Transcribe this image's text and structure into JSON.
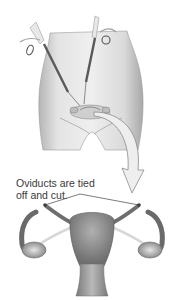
{
  "figure": {
    "top_panel": "Lower abdomen with two laparoscopic instruments inserted toward the pelvic organs",
    "bottom_panel": "Uterus with both oviducts tied off and cut, ovaries at sides",
    "caption": {
      "line1": "Oviducts are tied",
      "line2": "off and cut."
    },
    "colors": {
      "background": "#ffffff",
      "skin_light": "#e6e6e6",
      "skin_shadow": "#9a9a9a",
      "organ": "#8c8c8c",
      "text": "#3a3a3a",
      "arrow_fill": "#eeeeee",
      "arrow_stroke": "#8a8a8a"
    }
  }
}
